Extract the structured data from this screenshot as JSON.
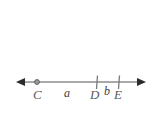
{
  "figure": {
    "type": "number-line-diagram",
    "title": "",
    "background_color": "#ffffff",
    "line_color": "#8d8d8d",
    "arrow_color": "#2b2b2b",
    "label_color": "#5a5a5a",
    "points": [
      {
        "id": "C",
        "label": "C",
        "x": 37,
        "marker": "dot"
      },
      {
        "id": "D",
        "label": "D",
        "x": 97,
        "marker": "tick"
      },
      {
        "id": "E",
        "label": "E",
        "x": 119,
        "marker": "tick"
      }
    ],
    "segments": [
      {
        "id": "a",
        "label": "a",
        "from": "C",
        "to": "D",
        "label_x": 68
      },
      {
        "id": "b",
        "label": "b",
        "from": "D",
        "to": "E",
        "label_x": 108
      }
    ],
    "axis": {
      "y": 82,
      "x_start": 16,
      "x_end": 146,
      "left_arrow": true,
      "right_arrow": true
    }
  }
}
